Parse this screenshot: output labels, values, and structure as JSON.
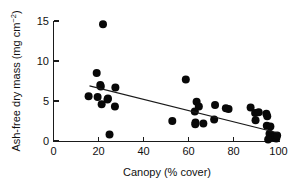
{
  "chart_data": {
    "type": "scatter",
    "title": "",
    "xlabel": "Canopy (% cover)",
    "ylabel_main": "Ash-free dry mass (mg cm",
    "ylabel_sup": "−2",
    "ylabel_tail": ")",
    "ylabel_full": "Ash-free dry mass (mg cm−2)",
    "xlim": [
      0,
      103
    ],
    "ylim": [
      0,
      15.8
    ],
    "xticks": [
      0,
      20,
      40,
      60,
      80,
      100
    ],
    "yticks": [
      0,
      5,
      10,
      15
    ],
    "xtick_labels": [
      "0",
      "20",
      "40",
      "60",
      "80",
      "100"
    ],
    "ytick_labels": [
      "0",
      "5",
      "10",
      "15"
    ],
    "grid": false,
    "legend": "none",
    "marker": "filled-circle",
    "marker_color": "#080808",
    "marker_size_px": 4.0,
    "points": [
      {
        "x": 22.0,
        "y": 14.6
      },
      {
        "x": 19.2,
        "y": 8.5
      },
      {
        "x": 20.8,
        "y": 7.0
      },
      {
        "x": 21.0,
        "y": 6.8
      },
      {
        "x": 27.5,
        "y": 6.7
      },
      {
        "x": 15.6,
        "y": 5.6
      },
      {
        "x": 19.6,
        "y": 5.5
      },
      {
        "x": 24.2,
        "y": 5.3
      },
      {
        "x": 24.0,
        "y": 5.2
      },
      {
        "x": 21.4,
        "y": 4.6
      },
      {
        "x": 27.3,
        "y": 4.3
      },
      {
        "x": 24.9,
        "y": 0.8
      },
      {
        "x": 52.8,
        "y": 2.5
      },
      {
        "x": 58.8,
        "y": 7.7
      },
      {
        "x": 63.6,
        "y": 4.9
      },
      {
        "x": 64.6,
        "y": 4.3
      },
      {
        "x": 62.8,
        "y": 3.7
      },
      {
        "x": 63.1,
        "y": 2.3
      },
      {
        "x": 63.0,
        "y": 2.1
      },
      {
        "x": 66.6,
        "y": 2.2
      },
      {
        "x": 71.4,
        "y": 2.7
      },
      {
        "x": 71.8,
        "y": 4.5
      },
      {
        "x": 76.6,
        "y": 4.1
      },
      {
        "x": 77.8,
        "y": 4.0
      },
      {
        "x": 87.6,
        "y": 4.2
      },
      {
        "x": 89.6,
        "y": 3.5
      },
      {
        "x": 91.2,
        "y": 3.6
      },
      {
        "x": 89.8,
        "y": 2.6
      },
      {
        "x": 94.6,
        "y": 3.4
      },
      {
        "x": 95.0,
        "y": 3.1
      },
      {
        "x": 94.8,
        "y": 1.9
      },
      {
        "x": 96.4,
        "y": 1.8
      },
      {
        "x": 96.0,
        "y": 0.9
      },
      {
        "x": 97.2,
        "y": 0.7
      },
      {
        "x": 97.6,
        "y": 0.5
      },
      {
        "x": 98.4,
        "y": 0.4
      },
      {
        "x": 99.0,
        "y": 0.3
      },
      {
        "x": 99.4,
        "y": 0.7
      },
      {
        "x": 95.4,
        "y": 0.2
      }
    ],
    "trendline": {
      "type": "linear-fit",
      "x_start": 16.0,
      "y_start": 6.9,
      "x_end": 100.0,
      "y_end": 1.0,
      "color": "#1a1a1a"
    }
  }
}
